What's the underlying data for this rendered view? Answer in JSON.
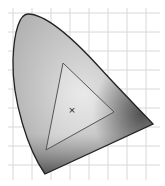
{
  "diagram": {
    "type": "cie-chromaticity-diagram",
    "grid": {
      "start": 13,
      "step": 19,
      "color": "#d8d8d8"
    },
    "gamut_triangle": {
      "points": [
        [
          63,
          63
        ],
        [
          114,
          112
        ],
        [
          46,
          150
        ]
      ],
      "stroke": "#555555"
    },
    "white_point": {
      "x": 72,
      "y": 110,
      "symbol": "×"
    },
    "outline_color": "#222222"
  }
}
